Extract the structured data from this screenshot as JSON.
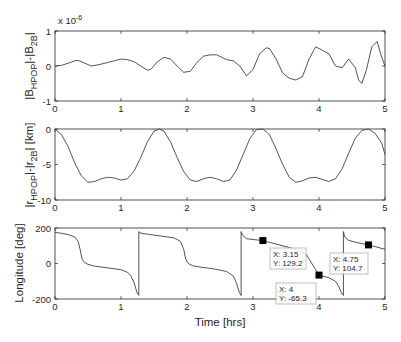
{
  "chart_data": [
    {
      "type": "line",
      "title": "",
      "exponent_label": "x 10",
      "exponent_power": "-6",
      "xlabel": "",
      "ylabel_main": "|B",
      "ylabel_sub1": "HPOP",
      "ylabel_mid": "|-|B",
      "ylabel_sub2": "2B",
      "ylabel_end": "|",
      "xlim": [
        0,
        5
      ],
      "ylim": [
        -1,
        1
      ],
      "xticks": [
        "0",
        "1",
        "2",
        "3",
        "4",
        "5"
      ],
      "yticks": [
        "1",
        "0",
        "-1"
      ],
      "x": [
        0,
        0.1,
        0.2,
        0.3,
        0.35,
        0.45,
        0.55,
        0.65,
        0.8,
        0.9,
        1.0,
        1.1,
        1.2,
        1.3,
        1.4,
        1.45,
        1.55,
        1.65,
        1.75,
        1.85,
        1.95,
        2.05,
        2.15,
        2.25,
        2.35,
        2.45,
        2.6,
        2.7,
        2.8,
        2.9,
        3.0,
        3.1,
        3.2,
        3.25,
        3.35,
        3.45,
        3.55,
        3.65,
        3.75,
        3.85,
        3.95,
        4.05,
        4.15,
        4.25,
        4.35,
        4.45,
        4.55,
        4.6,
        4.65,
        4.72,
        4.8,
        4.88,
        4.95,
        5.0
      ],
      "values": [
        0,
        0.02,
        0.08,
        0.15,
        0.16,
        0.08,
        0.0,
        0.03,
        0.1,
        0.15,
        0.2,
        0.18,
        0.12,
        0.0,
        -0.12,
        -0.1,
        0.12,
        0.25,
        0.2,
        0.0,
        -0.18,
        -0.15,
        0.1,
        0.28,
        0.32,
        0.32,
        0.18,
        0.15,
        0.0,
        -0.28,
        -0.1,
        0.35,
        0.52,
        0.5,
        0.2,
        -0.2,
        -0.35,
        -0.4,
        -0.3,
        0.2,
        0.55,
        0.45,
        0.35,
        0.0,
        -0.05,
        0.2,
        -0.05,
        -0.4,
        -0.5,
        -0.1,
        0.55,
        0.7,
        0.25,
        0.0
      ],
      "grid": false
    },
    {
      "type": "line",
      "title": "",
      "xlabel": "",
      "ylabel_main": "|r",
      "ylabel_sub1": "HPOP",
      "ylabel_mid": "|-|r",
      "ylabel_sub2": "2B",
      "ylabel_end": "| [km]",
      "xlim": [
        0,
        5
      ],
      "ylim": [
        -10,
        0
      ],
      "xticks": [
        "0",
        "1",
        "2",
        "3",
        "4",
        "5"
      ],
      "yticks": [
        "0",
        "-5",
        "-10"
      ],
      "x": [
        0,
        0.1,
        0.2,
        0.3,
        0.4,
        0.5,
        0.6,
        0.7,
        0.8,
        0.9,
        1.0,
        1.1,
        1.2,
        1.3,
        1.4,
        1.5,
        1.58,
        1.65,
        1.75,
        1.85,
        1.95,
        2.05,
        2.15,
        2.25,
        2.35,
        2.45,
        2.55,
        2.65,
        2.75,
        2.85,
        2.95,
        3.05,
        3.15,
        3.25,
        3.35,
        3.45,
        3.55,
        3.65,
        3.75,
        3.85,
        3.95,
        4.05,
        4.15,
        4.25,
        4.35,
        4.45,
        4.55,
        4.65,
        4.75,
        4.85,
        4.95,
        5.0
      ],
      "values": [
        0,
        -0.8,
        -2.5,
        -4.8,
        -6.6,
        -7.5,
        -7.4,
        -7.0,
        -6.8,
        -6.9,
        -7.2,
        -7.0,
        -5.9,
        -4.0,
        -1.8,
        -0.3,
        0,
        -0.3,
        -1.8,
        -4.0,
        -6.0,
        -7.2,
        -7.4,
        -7.0,
        -6.8,
        -7.0,
        -7.4,
        -7.2,
        -5.8,
        -3.6,
        -1.4,
        -0.1,
        0,
        -0.8,
        -2.8,
        -5.0,
        -6.8,
        -7.5,
        -7.3,
        -6.9,
        -6.8,
        -7.1,
        -7.4,
        -7.0,
        -5.6,
        -3.4,
        -1.3,
        -0.2,
        0,
        -0.6,
        -2.0,
        -3.6
      ],
      "grid": false
    },
    {
      "type": "line",
      "title": "",
      "xlabel": "Time [hrs]",
      "ylabel": "Longitude [deg]",
      "xlim": [
        0,
        5
      ],
      "ylim": [
        -200,
        200
      ],
      "xticks": [
        "0",
        "1",
        "2",
        "3",
        "4",
        "5"
      ],
      "yticks": [
        "200",
        "0",
        "-200"
      ],
      "segments": [
        {
          "x": [
            0,
            0.1,
            0.2,
            0.3,
            0.35,
            0.38,
            0.41,
            0.45,
            0.5,
            0.6,
            0.8,
            1.0,
            1.1,
            1.15,
            1.2,
            1.24,
            1.27
          ],
          "values": [
            175,
            170,
            163,
            150,
            125,
            80,
            25,
            5,
            -5,
            -15,
            -25,
            -35,
            -50,
            -70,
            -110,
            -160,
            -180
          ]
        },
        {
          "x": [
            1.27,
            1.29,
            1.4,
            1.6,
            1.8,
            1.9,
            1.95,
            1.98,
            2.02,
            2.08,
            2.2,
            2.4,
            2.6,
            2.7,
            2.75,
            2.79,
            2.82
          ],
          "values": [
            180,
            172,
            165,
            155,
            145,
            125,
            80,
            25,
            0,
            -12,
            -20,
            -30,
            -45,
            -70,
            -110,
            -160,
            -180
          ]
        },
        {
          "x": [
            2.82,
            2.84,
            2.9,
            3.0,
            3.15,
            3.4,
            3.6,
            3.8,
            4.0,
            4.15,
            4.25,
            4.3,
            4.34,
            4.37
          ],
          "values": [
            180,
            160,
            140,
            135,
            129.2,
            105,
            85,
            55,
            -65.3,
            -80,
            -100,
            -130,
            -165,
            -180
          ]
        },
        {
          "x": [
            4.37,
            4.39,
            4.45,
            4.55,
            4.65,
            4.75,
            4.85,
            5.0
          ],
          "values": [
            180,
            150,
            130,
            120,
            112,
            104.7,
            95,
            80
          ]
        }
      ],
      "datatips": [
        {
          "x_label": "X: 3.15",
          "y_label": "Y: 129.2",
          "x": 3.15,
          "y": 129.2
        },
        {
          "x_label": "X: 4",
          "y_label": "Y: -65.3",
          "x": 4,
          "y": -65.3
        },
        {
          "x_label": "X: 4.75",
          "y_label": "Y: 104.7",
          "x": 4.75,
          "y": 104.7
        }
      ],
      "grid": false
    }
  ],
  "colors": {
    "line": "#404040",
    "axes": "#262626",
    "box": "#b0b0b0",
    "marker": "#000000"
  }
}
